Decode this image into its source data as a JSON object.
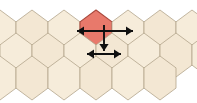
{
  "diagram": {
    "canvas": {
      "width": 197,
      "height": 103,
      "background": "#ffffff"
    },
    "colors": {
      "hex_fill": "#F6ECDA",
      "hex_fill_alt": "#F3E7D3",
      "hex_stroke": "#B3A58C",
      "highlight_fill": "#E8796B",
      "highlight_stroke": "#A8473B",
      "arrow": "#101010"
    },
    "grid": {
      "type": "hexagonal",
      "orientation": "flat-top-columns",
      "rows": 3,
      "hex_width": 32,
      "hex_height": 44,
      "row_offsets": [
        0,
        16,
        0
      ],
      "row_y": [
        10,
        33,
        56
      ],
      "counts_per_row": [
        7,
        7,
        6
      ]
    },
    "highlight": {
      "label": "selected-hex",
      "row": 0,
      "column": 3,
      "center_x": 95,
      "center_y": 31,
      "fill": "#E8796B"
    },
    "arrows": [
      {
        "name": "horizontal-arrow-upper",
        "kind": "double-headed",
        "orientation": "horizontal",
        "x1": 77,
        "x2": 133,
        "y": 31
      },
      {
        "name": "vertical-arrow-down",
        "kind": "single-headed",
        "orientation": "vertical",
        "x": 104,
        "y1": 25,
        "y2": 51,
        "direction": "down"
      },
      {
        "name": "horizontal-arrow-lower",
        "kind": "double-headed",
        "orientation": "horizontal",
        "x1": 87,
        "x2": 121,
        "y": 54
      }
    ]
  }
}
